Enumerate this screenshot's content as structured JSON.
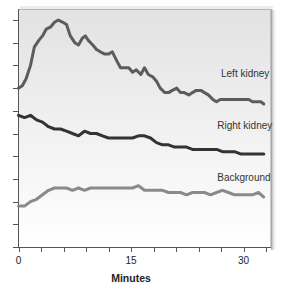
{
  "chart_data": {
    "type": "line",
    "title": "",
    "xlabel": "Minutes",
    "ylabel": "",
    "xlim": [
      0,
      33
    ],
    "ylim": [
      0,
      10
    ],
    "x_ticks": [
      0,
      3,
      6,
      9,
      12,
      15,
      18,
      21,
      24,
      27,
      30,
      33
    ],
    "x_tick_labels": [
      {
        "value": 0,
        "label": "0"
      },
      {
        "value": 15,
        "label": "15"
      },
      {
        "value": 30,
        "label": "30"
      }
    ],
    "y_ticks": [
      0,
      1,
      2,
      3,
      4,
      5,
      6,
      7,
      8,
      9,
      10
    ],
    "y_tick_labels": [],
    "grid": false,
    "legend": "inline labels near right end of each curve",
    "series": [
      {
        "name": "Left kidney",
        "color": "#5c5c5c",
        "label_pos": {
          "x": 27.0,
          "y": 7.5
        },
        "x": [
          0,
          0.5,
          1,
          1.6,
          2.1,
          2.7,
          3.2,
          3.7,
          4.3,
          4.8,
          5.3,
          5.9,
          6.4,
          6.9,
          7.5,
          8,
          8.5,
          8.9,
          9.3,
          9.9,
          10.4,
          10.9,
          11.5,
          12,
          12.5,
          13.1,
          13.6,
          14.1,
          14.7,
          15.2,
          15.7,
          16.3,
          16.8,
          17.3,
          17.9,
          18.4,
          18.9,
          19.5,
          20,
          20.5,
          21.1,
          21.6,
          22.1,
          22.7,
          23.2,
          23.7,
          24.3,
          24.8,
          25.3,
          25.9,
          26.4,
          26.9,
          27.5,
          28,
          28.5,
          29.1,
          29.6,
          30.1,
          30.7,
          31.2,
          31.7,
          32.3,
          32.7
        ],
        "values": [
          7.0,
          7.1,
          7.4,
          8.0,
          8.8,
          9.1,
          9.3,
          9.6,
          9.7,
          9.9,
          10.0,
          9.9,
          9.8,
          9.3,
          9.0,
          8.9,
          9.2,
          9.3,
          9.1,
          8.9,
          8.7,
          8.6,
          8.5,
          8.5,
          8.6,
          8.2,
          7.9,
          7.9,
          7.9,
          7.7,
          7.8,
          7.6,
          7.9,
          7.6,
          7.5,
          7.3,
          7.0,
          6.8,
          6.8,
          6.9,
          7.0,
          6.8,
          6.8,
          6.7,
          6.8,
          6.9,
          6.9,
          6.8,
          6.7,
          6.5,
          6.4,
          6.5,
          6.5,
          6.5,
          6.5,
          6.5,
          6.5,
          6.5,
          6.5,
          6.4,
          6.4,
          6.4,
          6.3
        ]
      },
      {
        "name": "Right kidney",
        "color": "#333333",
        "label_pos": {
          "x": 26.5,
          "y": 5.2
        },
        "x": [
          0,
          0.8,
          1.6,
          2.4,
          3.2,
          4,
          4.8,
          5.6,
          6.4,
          7.2,
          8,
          8.8,
          9.6,
          10.4,
          11.2,
          12,
          12.8,
          13.6,
          14.4,
          15.2,
          16,
          16.8,
          17.6,
          18.4,
          19.2,
          20,
          20.8,
          21.6,
          22.4,
          23.2,
          24,
          24.8,
          25.6,
          26.4,
          27.2,
          28,
          28.8,
          29.6,
          30.4,
          31.2,
          32,
          32.7
        ],
        "values": [
          5.8,
          5.7,
          5.8,
          5.6,
          5.5,
          5.3,
          5.2,
          5.2,
          5.1,
          5.0,
          4.9,
          5.1,
          5.0,
          5.0,
          4.9,
          4.8,
          4.8,
          4.8,
          4.8,
          4.8,
          4.9,
          4.9,
          4.8,
          4.6,
          4.5,
          4.5,
          4.4,
          4.4,
          4.4,
          4.3,
          4.3,
          4.3,
          4.3,
          4.3,
          4.2,
          4.2,
          4.2,
          4.1,
          4.1,
          4.1,
          4.1,
          4.1
        ]
      },
      {
        "name": "Background",
        "color": "#8a8a8a",
        "label_pos": {
          "x": 26.5,
          "y": 2.9
        },
        "x": [
          0,
          0.8,
          1.6,
          2.4,
          3.2,
          4,
          4.8,
          5.6,
          6.4,
          7.2,
          8,
          8.8,
          9.6,
          10.4,
          11.2,
          12,
          12.8,
          13.6,
          14.4,
          15.2,
          16,
          16.8,
          17.6,
          18.4,
          19.2,
          20,
          20.8,
          21.6,
          22.4,
          23.2,
          24,
          24.8,
          25.6,
          26.4,
          27.2,
          28,
          28.8,
          29.6,
          30.4,
          31.2,
          32,
          32.7
        ],
        "values": [
          1.8,
          1.8,
          2.0,
          2.1,
          2.3,
          2.5,
          2.6,
          2.6,
          2.6,
          2.5,
          2.6,
          2.5,
          2.6,
          2.6,
          2.6,
          2.6,
          2.6,
          2.6,
          2.6,
          2.6,
          2.7,
          2.5,
          2.5,
          2.5,
          2.5,
          2.4,
          2.4,
          2.4,
          2.3,
          2.4,
          2.4,
          2.4,
          2.3,
          2.4,
          2.5,
          2.4,
          2.3,
          2.3,
          2.3,
          2.3,
          2.4,
          2.2
        ]
      }
    ]
  },
  "panel": {
    "gradient_top": "#e2e2e2",
    "gradient_bottom": "#ffffff",
    "shadow": "#b0b0b0"
  }
}
